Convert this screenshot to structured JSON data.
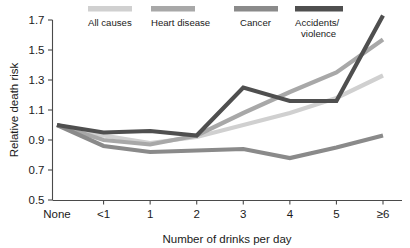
{
  "chart_data": {
    "type": "line",
    "title": "",
    "xlabel": "Number of drinks per day",
    "ylabel": "Relative death risk",
    "categories": [
      "None",
      "<1",
      "1",
      "2",
      "3",
      "4",
      "5",
      "≥6"
    ],
    "xlim": [
      0,
      7
    ],
    "ylim": [
      0.5,
      1.7
    ],
    "yticks": [
      "0.5",
      "0.7",
      "0.9",
      "1.1",
      "1.3",
      "1.5",
      "1.7"
    ],
    "ytick_values": [
      0.5,
      0.7,
      0.9,
      1.1,
      1.3,
      1.5,
      1.7
    ],
    "grid": false,
    "legend_position": "top",
    "series": [
      {
        "name": "All causes",
        "color": "#d0d0d0",
        "values": [
          1.0,
          0.93,
          0.88,
          0.92,
          1.0,
          1.08,
          1.18,
          1.33
        ]
      },
      {
        "name": "Heart disease",
        "color": "#a8a8a8",
        "values": [
          1.0,
          0.9,
          0.87,
          0.93,
          1.08,
          1.22,
          1.35,
          1.57
        ]
      },
      {
        "name": "Cancer",
        "color": "#8a8a8a",
        "values": [
          1.0,
          0.86,
          0.82,
          0.83,
          0.84,
          0.78,
          0.85,
          0.93
        ]
      },
      {
        "name": "Accidents/\nviolence",
        "color": "#4f4f4f",
        "values": [
          1.0,
          0.95,
          0.96,
          0.93,
          1.25,
          1.16,
          1.16,
          1.73
        ]
      }
    ]
  },
  "legend": {
    "items": [
      {
        "label": "All causes",
        "label2": "",
        "color": "#d0d0d0"
      },
      {
        "label": "Heart disease",
        "label2": "",
        "color": "#a8a8a8"
      },
      {
        "label": "Cancer",
        "label2": "",
        "color": "#8a8a8a"
      },
      {
        "label": "Accidents/",
        "label2": "violence",
        "color": "#4f4f4f"
      }
    ]
  }
}
